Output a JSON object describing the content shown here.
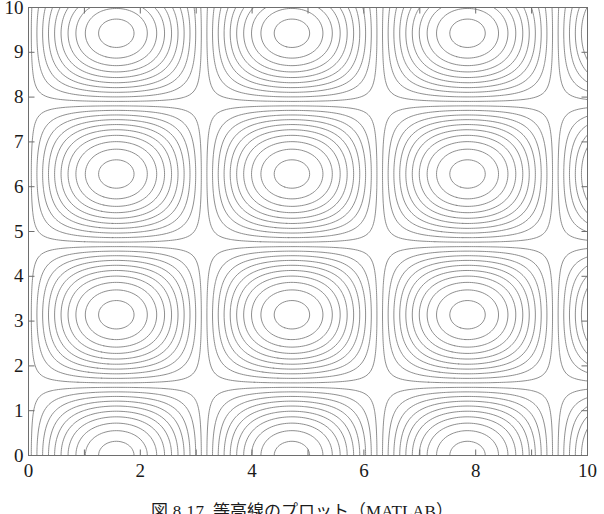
{
  "figure": {
    "kind": "contour-plot",
    "caption_prefix": "図",
    "caption_number": "8.17",
    "caption_text": "等高線のプロット（MATLAB）",
    "line_color": "#7a7a7a",
    "axis_color": "#6e6e6e",
    "background": "#ffffff"
  },
  "chart_data": {
    "type": "line",
    "subtype": "contour",
    "title": "",
    "xlabel": "",
    "ylabel": "",
    "xlim": [
      0,
      10
    ],
    "ylim": [
      0,
      10
    ],
    "xticks": [
      0,
      1,
      2,
      3,
      4,
      5,
      6,
      7,
      8,
      9,
      10
    ],
    "yticks": [
      0,
      1,
      2,
      3,
      4,
      5,
      6,
      7,
      8,
      9,
      10
    ],
    "xtick_labels": [
      "0",
      "",
      "2",
      "",
      "4",
      "",
      "6",
      "",
      "8",
      "",
      "10"
    ],
    "ytick_labels": [
      "0",
      "1",
      "2",
      "3",
      "4",
      "5",
      "6",
      "7",
      "8",
      "9",
      "10"
    ],
    "grid": false,
    "legend": "none",
    "tick_direction": "in",
    "n_levels": 20,
    "level_min": -0.95,
    "level_max": 0.95,
    "surface_formula": "z = sin(x) * cos(y)",
    "features": [
      {
        "type": "maximum",
        "x": 4.65,
        "y": 7.0,
        "note": "central closed peak, nested ellipses"
      },
      {
        "type": "maximum",
        "x": 1.6,
        "y": 0.0,
        "note": "bottom-left arc centre"
      },
      {
        "type": "maximum",
        "x": 7.8,
        "y": 0.0,
        "note": "bottom-right arc centre"
      },
      {
        "type": "minimum",
        "x": 1.6,
        "y": 10.0,
        "note": "top-left valley"
      },
      {
        "type": "minimum",
        "x": 7.8,
        "y": 10.0,
        "note": "top-right valley"
      },
      {
        "type": "minimum",
        "x": 4.65,
        "y": 0.9,
        "note": "bottom-centre valley"
      },
      {
        "type": "saddle",
        "x": 3.1,
        "y": 4.7,
        "note": "mid-left saddle"
      },
      {
        "type": "saddle",
        "x": 6.3,
        "y": 4.7,
        "note": "mid-right saddle"
      }
    ]
  }
}
